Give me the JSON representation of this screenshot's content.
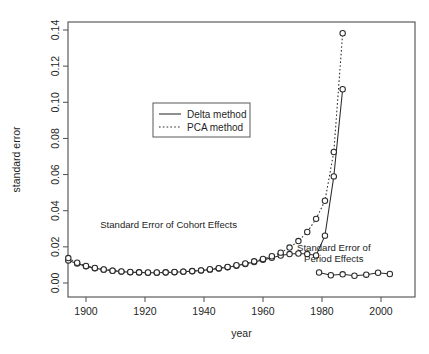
{
  "top_strip": {
    "fragments": [
      "",
      ""
    ]
  },
  "chart_data": {
    "type": "line",
    "title": "",
    "xlabel": "year",
    "ylabel": "standard error",
    "xlim": [
      1893,
      2005
    ],
    "ylim": [
      0.0,
      0.145
    ],
    "xticks": [
      1900,
      1920,
      1940,
      1960,
      1980,
      2000
    ],
    "xtick_labels": [
      "1900",
      "1920",
      "1940",
      "1960",
      "1980",
      "2000"
    ],
    "yticks": [
      0.0,
      0.02,
      0.04,
      0.06,
      0.08,
      0.1,
      0.12,
      0.14
    ],
    "ytick_labels": [
      "0.00",
      "0.02",
      "0.04",
      "0.06",
      "0.08",
      "0.10",
      "0.12",
      "0.14"
    ],
    "grid": false,
    "marker": "open-circle",
    "legend": {
      "position": "upper-left-inset",
      "entries": [
        {
          "name": "Delta method",
          "style": "solid"
        },
        {
          "name": "PCA method",
          "style": "dotted"
        }
      ]
    },
    "annotations": [
      {
        "text": "Standard Error of Cohort Effects",
        "x": 1928,
        "y": 0.0305
      },
      {
        "text": "Standard Error of Period Effects",
        "x": 1984,
        "y": 0.0175,
        "lines": [
          "Standard Error of",
          "Period Effects"
        ]
      }
    ],
    "series": [
      {
        "name": "Cohort Effects — Delta method",
        "group": "cohort",
        "method": "Delta method",
        "style": "solid",
        "x": [
          1894,
          1897,
          1900,
          1903,
          1906,
          1909,
          1912,
          1915,
          1918,
          1921,
          1924,
          1927,
          1930,
          1933,
          1936,
          1939,
          1942,
          1945,
          1948,
          1951,
          1954,
          1957,
          1960,
          1963,
          1966,
          1969,
          1972,
          1975,
          1978,
          1981,
          1984,
          1987
        ],
        "y": [
          0.0125,
          0.0108,
          0.0092,
          0.0082,
          0.0074,
          0.0068,
          0.0063,
          0.006,
          0.0058,
          0.0057,
          0.0057,
          0.0058,
          0.006,
          0.0062,
          0.0065,
          0.0069,
          0.0074,
          0.008,
          0.0087,
          0.0095,
          0.0105,
          0.0116,
          0.0128,
          0.014,
          0.0152,
          0.016,
          0.0163,
          0.016,
          0.0152,
          0.0262,
          0.059,
          0.1072
        ]
      },
      {
        "name": "Cohort Effects — PCA method",
        "group": "cohort",
        "method": "PCA method",
        "style": "dotted",
        "x": [
          1894,
          1897,
          1900,
          1903,
          1906,
          1909,
          1912,
          1915,
          1918,
          1921,
          1924,
          1927,
          1930,
          1933,
          1936,
          1939,
          1942,
          1945,
          1948,
          1951,
          1954,
          1957,
          1960,
          1963,
          1966,
          1969,
          1972,
          1975,
          1978,
          1981,
          1984,
          1987
        ],
        "y": [
          0.0138,
          0.0112,
          0.0094,
          0.0083,
          0.0075,
          0.0068,
          0.0064,
          0.0061,
          0.0059,
          0.0058,
          0.0058,
          0.0059,
          0.0061,
          0.0063,
          0.0066,
          0.007,
          0.0076,
          0.0082,
          0.0089,
          0.0098,
          0.0108,
          0.012,
          0.0133,
          0.0148,
          0.0168,
          0.0196,
          0.0232,
          0.0282,
          0.0355,
          0.0455,
          0.0725,
          0.1382
        ]
      },
      {
        "name": "Period Effects",
        "group": "period",
        "method": "Delta method",
        "style": "solid",
        "x": [
          1979,
          1983,
          1987,
          1991,
          1995,
          1999,
          2003
        ],
        "y": [
          0.0058,
          0.0043,
          0.0048,
          0.004,
          0.0046,
          0.0057,
          0.005
        ]
      }
    ]
  }
}
